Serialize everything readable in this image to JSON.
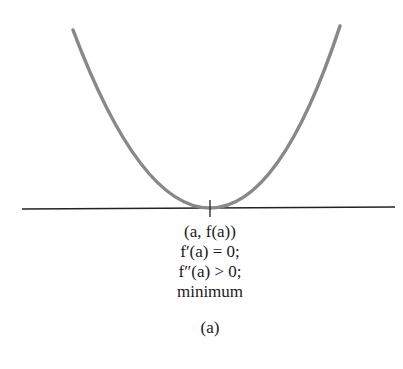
{
  "figure": {
    "type": "function-graph",
    "curve": "parabola opening upward with minimum on horizontal axis",
    "curve_color": "#888888",
    "axis_color": "#222222",
    "point_label": "(a, f(a))",
    "condition_1": "f′(a) = 0;",
    "condition_2": "f″(a) > 0;",
    "classification": "minimum",
    "caption": "(a)"
  }
}
